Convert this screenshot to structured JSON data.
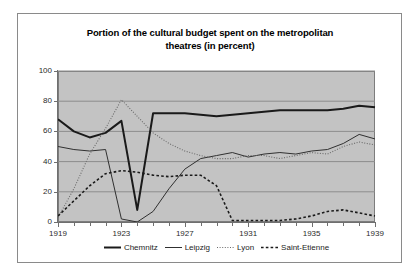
{
  "chart_data": {
    "type": "line",
    "title": "Portion of the cultural budget spent on the metropolitan theatres (in percent)",
    "title_line1": "Portion of the cultural budget spent on the metropolitan",
    "title_line2": "theatres (in percent)",
    "xlabel": "",
    "ylabel": "",
    "xlim": [
      1919,
      1939
    ],
    "ylim": [
      0,
      100
    ],
    "ytick_labels": [
      "0",
      "20",
      "40",
      "60",
      "80",
      "100"
    ],
    "ytick_values": [
      0,
      20,
      40,
      60,
      80,
      100
    ],
    "xtick_labels": [
      "1919",
      "1923",
      "1927",
      "1931",
      "1935",
      "1939"
    ],
    "xtick_values": [
      1919,
      1923,
      1927,
      1931,
      1935,
      1939
    ],
    "x": [
      1919,
      1920,
      1921,
      1922,
      1923,
      1924,
      1925,
      1926,
      1927,
      1928,
      1929,
      1930,
      1931,
      1932,
      1933,
      1934,
      1935,
      1936,
      1937,
      1938,
      1939
    ],
    "grid": "horizontal",
    "legend_position": "bottom",
    "plot_background": "#c3c3c3",
    "series": [
      {
        "name": "Chemnitz",
        "style": "solid-thick",
        "color": "#1a1a1a",
        "values": [
          68,
          60,
          56,
          59,
          67,
          8,
          72,
          72,
          72,
          71,
          70,
          71,
          72,
          73,
          74,
          74,
          74,
          74,
          75,
          77,
          76
        ]
      },
      {
        "name": "Leipzig",
        "style": "solid-thin",
        "color": "#303030",
        "values": [
          50,
          48,
          47,
          48,
          2,
          0,
          7,
          22,
          35,
          42,
          44,
          46,
          43,
          45,
          46,
          45,
          47,
          48,
          52,
          58,
          55
        ]
      },
      {
        "name": "Lyon",
        "style": "dotted",
        "color": "#6b6b6b",
        "values": [
          3,
          22,
          45,
          62,
          81,
          70,
          59,
          52,
          47,
          44,
          42,
          42,
          44,
          44,
          42,
          44,
          46,
          45,
          50,
          53,
          51
        ]
      },
      {
        "name": "Saint-Etienne",
        "style": "dashed",
        "color": "#1a1a1a",
        "values": [
          4,
          14,
          24,
          32,
          34,
          33,
          31,
          30,
          31,
          31,
          24,
          1,
          1,
          1,
          1,
          2,
          4,
          7,
          8,
          6,
          4
        ]
      }
    ]
  },
  "legend": {
    "items": [
      {
        "label": "Chemnitz"
      },
      {
        "label": "Leipzig"
      },
      {
        "label": "Lyon"
      },
      {
        "label": "Saint-Etienne"
      }
    ]
  }
}
